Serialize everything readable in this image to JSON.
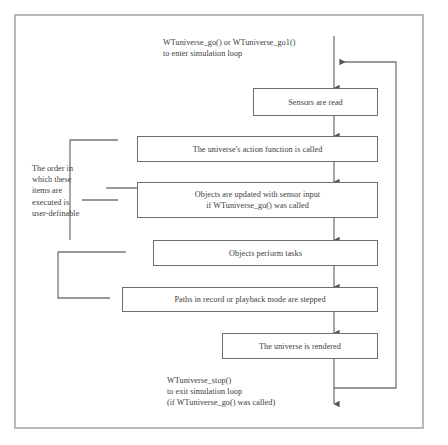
{
  "diagram": {
    "colors": {
      "frame_border": "#b9b9b9",
      "node_border": "#6e6e6e",
      "wire": "#777777",
      "text": "#3c3c3c",
      "background": "#ffffff"
    },
    "entry_label": "WTuniverse_go() or WTuniverse_go1()\nto enter simulation loop",
    "exit_label": "WTuniverse_stop()\nto exit simulation loop\n(if WTuniverse_go() was called)",
    "order_note": "The order in\nwhich these\nitems are\nexecuted is\nuser-definable",
    "steps": [
      {
        "id": "sensors-read",
        "label": "Sensors are read"
      },
      {
        "id": "universe-action-function",
        "label": "The universe's action function is called"
      },
      {
        "id": "objects-updated",
        "label": "Objects are updated with sensor input\nif WTuniverse_go() was called"
      },
      {
        "id": "objects-perform-tasks",
        "label": "Objects perform tasks"
      },
      {
        "id": "paths-stepped",
        "label": "Paths in record or playback mode are stepped"
      },
      {
        "id": "universe-rendered",
        "label": "The universe is rendered"
      }
    ]
  }
}
